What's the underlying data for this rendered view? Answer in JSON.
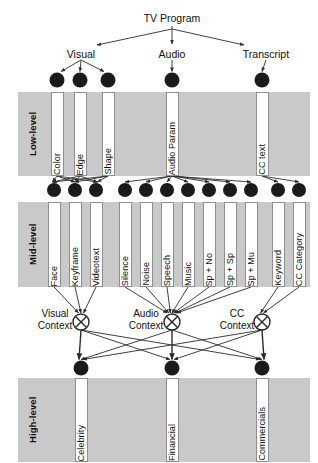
{
  "diagram": {
    "title": "TV Program",
    "root": {
      "label": "TV Program",
      "x": 172,
      "y": 12
    },
    "modalities": [
      {
        "label": "Visual",
        "x": 81,
        "y": 48
      },
      {
        "label": "Audio",
        "x": 172,
        "y": 48
      },
      {
        "label": "Transcript",
        "x": 266,
        "y": 48
      }
    ],
    "bands": [
      {
        "label": "Low-level",
        "x": 18,
        "y": 92,
        "w": 292,
        "h": 84,
        "label_x": 22,
        "label_y": 96,
        "label_w": 20,
        "label_h": 76
      },
      {
        "label": "Mid-level",
        "x": 18,
        "y": 202,
        "w": 292,
        "h": 85,
        "label_x": 22,
        "label_y": 206,
        "label_w": 20,
        "label_h": 77
      },
      {
        "label": "High-level",
        "x": 18,
        "y": 378,
        "w": 292,
        "h": 84,
        "label_x": 22,
        "label_y": 382,
        "label_w": 20,
        "label_h": 76
      }
    ],
    "low_level": {
      "nodes": [
        {
          "label": "Color",
          "x": 57,
          "y": 80
        },
        {
          "label": "Edge",
          "x": 80,
          "y": 80
        },
        {
          "label": "Shape",
          "x": 108,
          "y": 80
        },
        {
          "label": "Audio Param",
          "x": 172,
          "y": 80
        },
        {
          "label": "CC text",
          "x": 262,
          "y": 80
        }
      ],
      "box_top": 92,
      "box_h": 84,
      "box_w": 13
    },
    "mid_level": {
      "nodes": [
        {
          "label": "Face",
          "x": 54,
          "y": 190
        },
        {
          "label": "Keyframe",
          "x": 75,
          "y": 190
        },
        {
          "label": "Videotext",
          "x": 96,
          "y": 190
        },
        {
          "label": "Silence",
          "x": 125,
          "y": 190
        },
        {
          "label": "Noise",
          "x": 146,
          "y": 190
        },
        {
          "label": "Speech",
          "x": 167,
          "y": 190
        },
        {
          "label": "Music",
          "x": 188,
          "y": 190
        },
        {
          "label": "Sp + No",
          "x": 209,
          "y": 190
        },
        {
          "label": "Sp + Sp",
          "x": 230,
          "y": 190
        },
        {
          "label": "Sp + Mu",
          "x": 251,
          "y": 190
        },
        {
          "label": "Keyword",
          "x": 278,
          "y": 190
        },
        {
          "label": "CC Category",
          "x": 299,
          "y": 190
        }
      ],
      "box_top": 202,
      "box_h": 85,
      "box_w": 13
    },
    "contexts": [
      {
        "label": "Visual Context",
        "line1": "Visual",
        "line2": "Context",
        "x": 81,
        "y": 322,
        "label_x": 30,
        "label_y": 308
      },
      {
        "label": "Audio Context",
        "line1": "Audio",
        "line2": "Context",
        "x": 172,
        "y": 322,
        "label_x": 121,
        "label_y": 308
      },
      {
        "label": "CC Context",
        "line1": "CC",
        "line2": "Context",
        "x": 262,
        "y": 322,
        "label_x": 212,
        "label_y": 308
      }
    ],
    "high_level": {
      "nodes": [
        {
          "label": "Celebrity",
          "x": 81,
          "y": 368
        },
        {
          "label": "Financial",
          "x": 172,
          "y": 368
        },
        {
          "label": "Commercials",
          "x": 262,
          "y": 368
        }
      ],
      "box_top": 378,
      "box_h": 84,
      "box_w": 13
    },
    "colors": {
      "band": "#c9c9c9",
      "node": "#1a1a1a",
      "line": "#2b2b2b",
      "box_fill": "#ffffff",
      "box_border": "#8f8f8f"
    }
  }
}
